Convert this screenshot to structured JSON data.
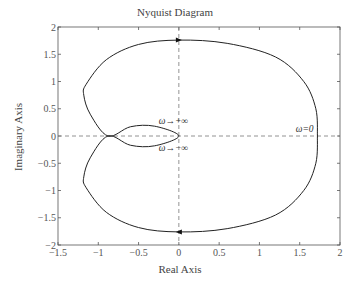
{
  "chart_data": {
    "type": "line",
    "title": "Nyquist Diagram",
    "xlabel": "Real Axis",
    "ylabel": "Imaginary Axis",
    "xlim": [
      -1.5,
      2
    ],
    "ylim": [
      -2,
      2
    ],
    "xticks": [
      "-1.5",
      "-1",
      "-0.5",
      "0",
      "0.5",
      "1",
      "1.5",
      "2"
    ],
    "yticks": [
      "-2",
      "-1.5",
      "-1",
      "-0.5",
      "0",
      "0.5",
      "1",
      "1.5",
      "2"
    ],
    "grid": false,
    "reference_lines": [
      {
        "orientation": "horizontal",
        "value": 0,
        "style": "dashed"
      },
      {
        "orientation": "vertical",
        "value": 0,
        "style": "dashed"
      }
    ],
    "series": [
      {
        "name": "Nyquist curve (ω>0 and ω<0)",
        "points": [
          [
            1.72,
            0
          ],
          [
            1.7,
            0.5
          ],
          [
            1.55,
            1.0
          ],
          [
            1.2,
            1.45
          ],
          [
            0.6,
            1.7
          ],
          [
            0,
            1.76
          ],
          [
            -0.5,
            1.68
          ],
          [
            -0.9,
            1.4
          ],
          [
            -1.15,
            0.95
          ],
          [
            -1.18,
            0.75
          ],
          [
            -1.1,
            0.4
          ],
          [
            -0.88,
            0
          ],
          [
            -0.6,
            0.17
          ],
          [
            -0.3,
            0.18
          ],
          [
            0,
            0
          ],
          [
            -0.3,
            -0.18
          ],
          [
            -0.6,
            -0.17
          ],
          [
            -0.88,
            0
          ],
          [
            -1.1,
            -0.4
          ],
          [
            -1.18,
            -0.75
          ],
          [
            -1.15,
            -0.95
          ],
          [
            -0.9,
            -1.4
          ],
          [
            -0.5,
            -1.68
          ],
          [
            0,
            -1.76
          ],
          [
            0.6,
            -1.7
          ],
          [
            1.2,
            -1.45
          ],
          [
            1.55,
            -1.0
          ],
          [
            1.7,
            -0.5
          ],
          [
            1.72,
            0
          ]
        ]
      }
    ],
    "annotations": [
      {
        "text": "ω→+∞",
        "x": -0.25,
        "y": 0.22
      },
      {
        "text": "ω→−∞",
        "x": -0.25,
        "y": -0.28
      },
      {
        "text": "ω=0",
        "x": 1.45,
        "y": 0.08
      }
    ],
    "arrows": [
      {
        "at": [
          0,
          1.76
        ],
        "direction": "right"
      },
      {
        "at": [
          0,
          -1.76
        ],
        "direction": "left"
      }
    ]
  }
}
